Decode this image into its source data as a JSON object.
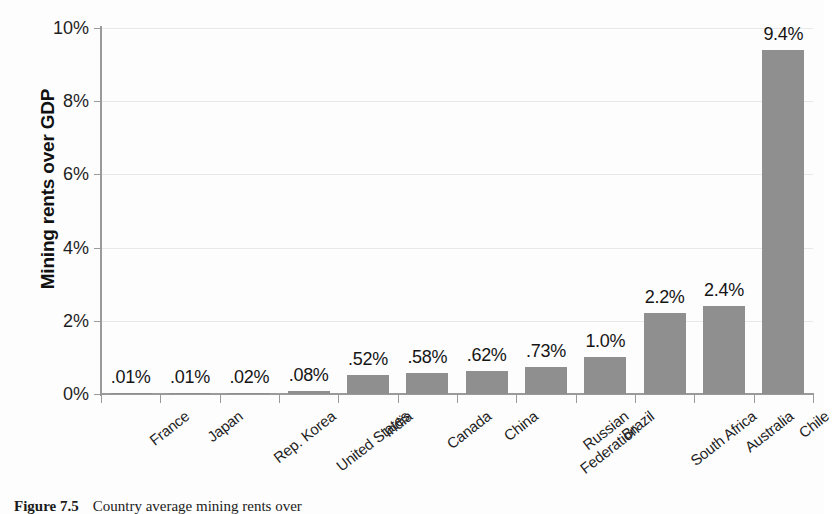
{
  "figure": {
    "caption_label": "Figure 7.5",
    "caption_text": "Country average mining rents over"
  },
  "chart_data": {
    "type": "bar",
    "title": "",
    "xlabel": "",
    "ylabel": "Mining rents over GDP",
    "ylim": [
      0,
      10
    ],
    "ytick_labels": [
      "0%",
      "2%",
      "4%",
      "6%",
      "8%",
      "10%"
    ],
    "ytick_values": [
      0,
      2,
      4,
      6,
      8,
      10
    ],
    "grid": true,
    "legend": "none",
    "bar_color": "#8f8f8f",
    "categories": [
      "France",
      "Japan",
      "Rep. Korea",
      "United States",
      "India",
      "Canada",
      "China",
      "Russian Federation",
      "Brazil",
      "South Africa",
      "Australia",
      "Chile"
    ],
    "category_lines": [
      [
        "France"
      ],
      [
        "Japan"
      ],
      [
        "Rep. Korea"
      ],
      [
        "United States"
      ],
      [
        "India"
      ],
      [
        "Canada"
      ],
      [
        "China"
      ],
      [
        "Russian",
        "Federation"
      ],
      [
        "Brazil"
      ],
      [
        "South Africa"
      ],
      [
        "Australia"
      ],
      [
        "Chile"
      ]
    ],
    "values": [
      0.01,
      0.01,
      0.02,
      0.08,
      0.52,
      0.58,
      0.62,
      0.73,
      1.0,
      2.2,
      2.4,
      9.4
    ],
    "data_labels": [
      ".01%",
      ".01%",
      ".02%",
      ".08%",
      ".52%",
      ".58%",
      ".62%",
      ".73%",
      "1.0%",
      "2.2%",
      "2.4%",
      "9.4%"
    ]
  }
}
